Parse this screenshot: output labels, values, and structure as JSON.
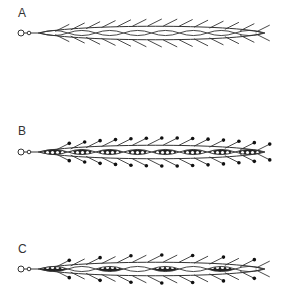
{
  "figure": {
    "panels": [
      {
        "label": "A",
        "type": "unornamented",
        "spine_color": "#333333",
        "segments": 8,
        "segment_fill": "none",
        "hair_tips": "none",
        "hairs_per_side": 14
      },
      {
        "label": "B",
        "type": "fully-beaded",
        "spine_color": "#333333",
        "segments": 8,
        "segment_fill": "beaded",
        "hair_tips": "dot",
        "hairs_per_side": 14
      },
      {
        "label": "C",
        "type": "alternating-beaded",
        "spine_color": "#333333",
        "segments": 8,
        "segment_fill": "alternate",
        "hair_tips": "alternate-dot",
        "hairs_per_side": 14
      }
    ]
  }
}
